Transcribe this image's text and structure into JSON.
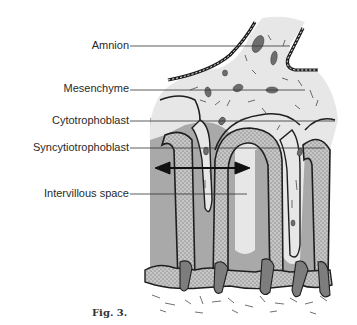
{
  "figure": {
    "caption": "Fig. 3.",
    "labels": [
      {
        "id": "amnion",
        "text": "Amnion"
      },
      {
        "id": "mesenchyme",
        "text": "Mesenchyme"
      },
      {
        "id": "cytotrophoblast",
        "text": "Cytotrophoblast"
      },
      {
        "id": "syncytiotrophoblast",
        "text": "Syncytiotrophoblast"
      },
      {
        "id": "intervillous-space",
        "text": "Intervillous space"
      }
    ]
  },
  "colors": {
    "background": "#ffffff",
    "mesenchyme_fill": "#e6e6e6",
    "intervillous_fill": "#a8a8a8",
    "trophoblast_fill": "#c4c4c4",
    "outline": "#1e1e1e",
    "cell_fill": "#6e6e6e"
  }
}
